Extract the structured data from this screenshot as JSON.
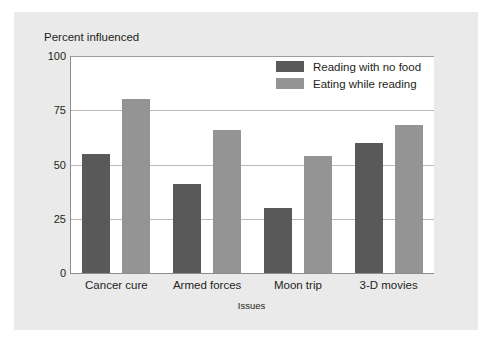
{
  "chart_data": {
    "type": "bar",
    "title": "",
    "xlabel": "Issues",
    "ylabel": "Percent influenced",
    "categories": [
      "Cancer cure",
      "Armed forces",
      "Moon trip",
      "3-D movies"
    ],
    "series": [
      {
        "name": "Reading with no food",
        "color": "#595959",
        "values": [
          55,
          41,
          30,
          60
        ]
      },
      {
        "name": "Eating while reading",
        "color": "#949494",
        "values": [
          80,
          66,
          54,
          68
        ]
      }
    ],
    "ylim": [
      0,
      100
    ],
    "yticks": [
      0,
      25,
      50,
      75,
      100
    ],
    "ytick_labels": [
      "0",
      "25",
      "50",
      "75",
      "100"
    ],
    "grid": true,
    "legend_position": "top-right"
  }
}
